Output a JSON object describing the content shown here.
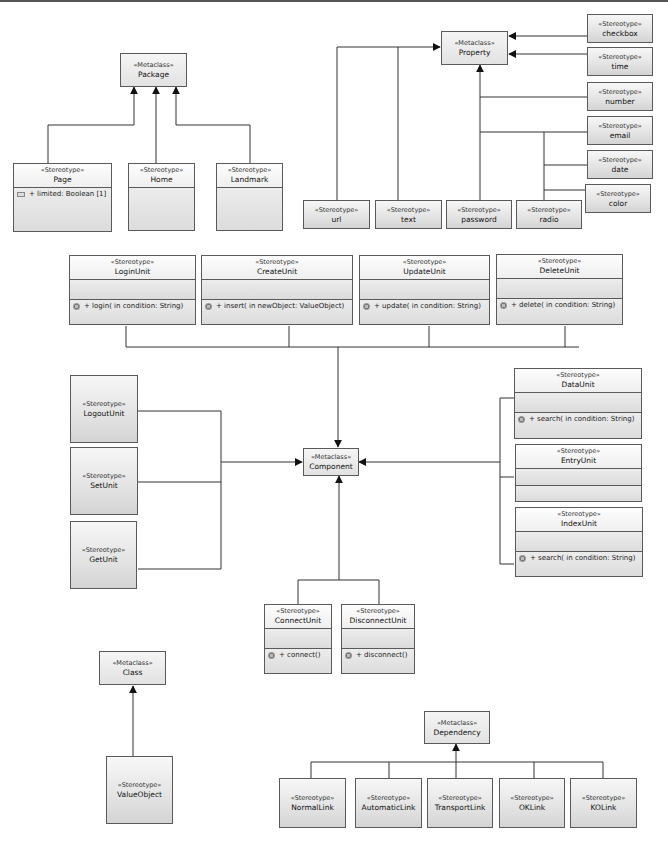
{
  "diagram": {
    "stereotype_label": "«Stereotype»",
    "metaclass_label": "«Metaclass»",
    "metaclasses": {
      "package": "Package",
      "property": "Property",
      "component": "Component",
      "class": "Class",
      "dependency": "Dependency"
    },
    "package_group": {
      "page": {
        "name": "Page",
        "attribute": "+ limited: Boolean [1]"
      },
      "home": {
        "name": "Home"
      },
      "landmark": {
        "name": "Landmark"
      }
    },
    "property_group": {
      "checkbox": "checkbox",
      "time": "time",
      "number": "number",
      "email": "email",
      "date": "date",
      "color": "color",
      "url": "url",
      "text": "text",
      "password": "password",
      "radio": "radio"
    },
    "component_group": {
      "login": {
        "name": "LoginUnit",
        "operation": "+ login(  in condition: String)"
      },
      "create": {
        "name": "CreateUnit",
        "operation": "+ insert(  in newObject: ValueObject)"
      },
      "update": {
        "name": "UpdateUnit",
        "operation": "+ update(  in condition: String)"
      },
      "delete": {
        "name": "DeleteUnit",
        "operation": "+ delete(  in condition: String)"
      },
      "logout": {
        "name": "LogoutUnit"
      },
      "set": {
        "name": "SetUnit"
      },
      "get": {
        "name": "GetUnit"
      },
      "data": {
        "name": "DataUnit",
        "operation": "+ search(  in condition: String)"
      },
      "entry": {
        "name": "EntryUnit"
      },
      "index": {
        "name": "IndexUnit",
        "operation": "+ search(  in condition: String)"
      },
      "connect": {
        "name": "ConnectUnit",
        "operation": "+ connect()"
      },
      "disconnect": {
        "name": "DisconnectUnit",
        "operation": "+ disconnect()"
      }
    },
    "class_group": {
      "valueobject": "ValueObject"
    },
    "dependency_group": {
      "normal": "NormalLink",
      "automatic": "AutomaticLink",
      "transport": "TransportLink",
      "ok": "OKLink",
      "ko": "KOLink"
    }
  }
}
